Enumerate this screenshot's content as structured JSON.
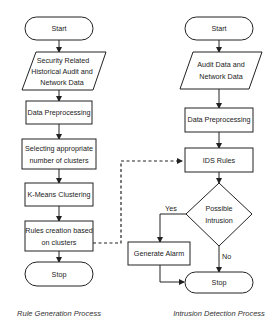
{
  "diagram": {
    "type": "flowchart",
    "left_process": {
      "caption": "Rule Generation Process",
      "nodes": [
        {
          "id": "L0",
          "shape": "terminal",
          "lines": [
            "Start"
          ]
        },
        {
          "id": "L1",
          "shape": "data",
          "lines": [
            "Security Related",
            "Historical Audit  and",
            "Network Data"
          ]
        },
        {
          "id": "L2",
          "shape": "process",
          "lines": [
            "Data Preprocessing"
          ]
        },
        {
          "id": "L3",
          "shape": "process",
          "lines": [
            "Selecting appropriate",
            "number of clusters"
          ]
        },
        {
          "id": "L4",
          "shape": "process",
          "lines": [
            "K-Means Clustering"
          ]
        },
        {
          "id": "L5",
          "shape": "process",
          "lines": [
            "Rules creation based",
            "on clusters"
          ]
        },
        {
          "id": "L6",
          "shape": "terminal",
          "lines": [
            "Stop"
          ]
        }
      ]
    },
    "right_process": {
      "caption": "Intrusion Detection Process",
      "nodes": [
        {
          "id": "R0",
          "shape": "terminal",
          "lines": [
            "Start"
          ]
        },
        {
          "id": "R1",
          "shape": "data",
          "lines": [
            "Audit Data and",
            "Network Data"
          ]
        },
        {
          "id": "R2",
          "shape": "process",
          "lines": [
            "Data Preprocessing"
          ]
        },
        {
          "id": "R3",
          "shape": "process",
          "lines": [
            "IDS Rules"
          ]
        },
        {
          "id": "R4",
          "shape": "decision",
          "lines": [
            "Possible",
            "Intrusion"
          ]
        },
        {
          "id": "R5",
          "shape": "process",
          "lines": [
            "Generate Alarm"
          ]
        },
        {
          "id": "R6",
          "shape": "terminal",
          "lines": [
            "Stop"
          ]
        }
      ]
    },
    "edges": [
      {
        "from": "L0",
        "to": "L1"
      },
      {
        "from": "L1",
        "to": "L2"
      },
      {
        "from": "L2",
        "to": "L3"
      },
      {
        "from": "L3",
        "to": "L4"
      },
      {
        "from": "L4",
        "to": "L5"
      },
      {
        "from": "L5",
        "to": "L6"
      },
      {
        "from": "L5",
        "to": "R3",
        "style": "dashed"
      },
      {
        "from": "R0",
        "to": "R1"
      },
      {
        "from": "R1",
        "to": "R2"
      },
      {
        "from": "R2",
        "to": "R3"
      },
      {
        "from": "R3",
        "to": "R4"
      },
      {
        "from": "R4",
        "to": "R5",
        "label": "Yes"
      },
      {
        "from": "R4",
        "to": "R6",
        "label": "No"
      },
      {
        "from": "R5",
        "to": "R6"
      }
    ],
    "edge_labels": {
      "yes": "Yes",
      "no": "No"
    }
  }
}
